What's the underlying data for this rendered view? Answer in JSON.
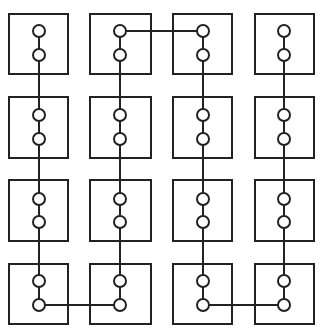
{
  "diagram": {
    "title": "",
    "colors": {
      "stroke": "#222222",
      "fill": "#ffffff",
      "background": "#ffffff"
    },
    "stroke_width": 2,
    "node_radius": 6,
    "columns": [
      {
        "index": 0,
        "box_left": 9,
        "box_right": 68,
        "node_x": 39
      },
      {
        "index": 1,
        "box_left": 90,
        "box_right": 151,
        "node_x": 120
      },
      {
        "index": 2,
        "box_left": 173,
        "box_right": 232,
        "node_x": 203
      },
      {
        "index": 3,
        "box_left": 255,
        "box_right": 314,
        "node_x": 284
      }
    ],
    "rows": [
      {
        "index": 0,
        "box_top": 14,
        "box_bottom": 74,
        "node_top_y": 31,
        "node_bottom_y": 55
      },
      {
        "index": 1,
        "box_top": 97,
        "box_bottom": 158,
        "node_top_y": 115,
        "node_bottom_y": 139
      },
      {
        "index": 2,
        "box_top": 180,
        "box_bottom": 241,
        "node_top_y": 199,
        "node_bottom_y": 222
      },
      {
        "index": 3,
        "box_top": 264,
        "box_bottom": 324,
        "node_top_y": 281,
        "node_bottom_y": 305
      }
    ],
    "vertical_links": [
      {
        "col": 0,
        "from_row": 0,
        "to_row": 3
      },
      {
        "col": 1,
        "from_row": 0,
        "to_row": 3
      },
      {
        "col": 2,
        "from_row": 0,
        "to_row": 3
      },
      {
        "col": 3,
        "from_row": 0,
        "to_row": 3
      }
    ],
    "horizontal_links": [
      {
        "row": 3,
        "node": "bottom",
        "from_col": 0,
        "to_col": 1
      },
      {
        "row": 0,
        "node": "top",
        "from_col": 1,
        "to_col": 2
      },
      {
        "row": 3,
        "node": "bottom",
        "from_col": 2,
        "to_col": 3
      }
    ]
  }
}
